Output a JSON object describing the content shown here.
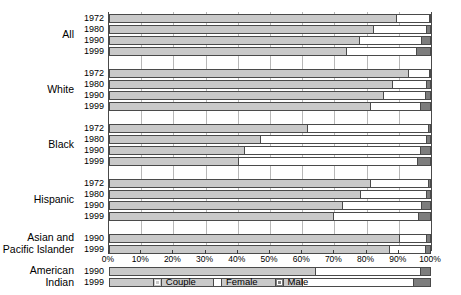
{
  "chart_data": {
    "type": "bar",
    "orientation": "horizontal",
    "stacked": true,
    "stack_total": 100,
    "title": "",
    "xlabel": "",
    "ylabel": "",
    "xlim": [
      0,
      100
    ],
    "grid": true,
    "legend_position": "bottom-center",
    "x_tick_labels": [
      "0%",
      "10%",
      "20%",
      "30%",
      "40%",
      "50%",
      "60%",
      "70%",
      "80%",
      "90%",
      "100%"
    ],
    "x_tick_values": [
      0,
      10,
      20,
      30,
      40,
      50,
      60,
      70,
      80,
      90,
      100
    ],
    "series": [
      {
        "name": "Couple",
        "color": "#c9c9c9"
      },
      {
        "name": "Female",
        "color": "#ffffff"
      },
      {
        "name": "Male",
        "color": "#7d7d7d"
      }
    ],
    "groups": [
      {
        "label": "All",
        "rows": [
          {
            "year": "1972",
            "couple": 89.0,
            "female": 10.4,
            "male": 0.6
          },
          {
            "year": "1980",
            "couple": 82.0,
            "female": 16.5,
            "male": 1.5
          },
          {
            "year": "1990",
            "couple": 77.5,
            "female": 19.5,
            "male": 3.0
          },
          {
            "year": "1999",
            "couple": 73.5,
            "female": 22.0,
            "male": 4.5
          }
        ]
      },
      {
        "label": "White",
        "rows": [
          {
            "year": "1972",
            "couple": 93.0,
            "female": 6.4,
            "male": 0.6
          },
          {
            "year": "1980",
            "couple": 88.0,
            "female": 10.6,
            "male": 1.4
          },
          {
            "year": "1990",
            "couple": 85.0,
            "female": 13.0,
            "male": 2.0
          },
          {
            "year": "1999",
            "couple": 81.0,
            "female": 15.6,
            "male": 3.4
          }
        ]
      },
      {
        "label": "Black",
        "rows": [
          {
            "year": "1972",
            "couple": 61.5,
            "female": 37.5,
            "male": 1.0
          },
          {
            "year": "1980",
            "couple": 47.0,
            "female": 51.5,
            "male": 1.5
          },
          {
            "year": "1990",
            "couple": 42.0,
            "female": 54.5,
            "male": 3.5
          },
          {
            "year": "1999",
            "couple": 40.0,
            "female": 55.5,
            "male": 4.5
          }
        ]
      },
      {
        "label": "Hispanic",
        "rows": [
          {
            "year": "1972",
            "couple": 81.0,
            "female": 18.0,
            "male": 1.0
          },
          {
            "year": "1980",
            "couple": 78.0,
            "female": 20.5,
            "male": 1.5
          },
          {
            "year": "1990",
            "couple": 72.5,
            "female": 24.5,
            "male": 3.0
          },
          {
            "year": "1999",
            "couple": 69.5,
            "female": 26.5,
            "male": 4.0
          }
        ]
      },
      {
        "label": "Asian and\nPacific Islander",
        "rows": [
          {
            "year": "1990",
            "couple": 90.0,
            "female": 8.5,
            "male": 1.5
          },
          {
            "year": "1999",
            "couple": 87.0,
            "female": 11.0,
            "male": 2.0
          }
        ]
      },
      {
        "label": "American\nIndian",
        "rows": [
          {
            "year": "1990",
            "couple": 64.0,
            "female": 32.5,
            "male": 3.5
          },
          {
            "year": "1999",
            "couple": 60.0,
            "female": 34.5,
            "male": 5.5
          }
        ]
      }
    ]
  },
  "legend": {
    "items": [
      {
        "label": "Couple",
        "swatch": "couple"
      },
      {
        "label": "Female",
        "swatch": "female"
      },
      {
        "label": "Male",
        "swatch": "male"
      }
    ]
  }
}
